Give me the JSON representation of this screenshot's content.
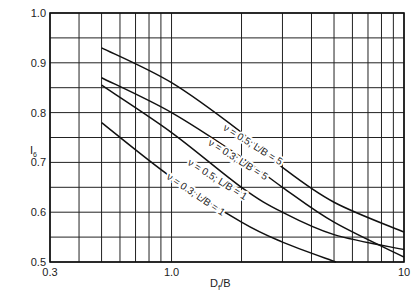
{
  "chart_data": {
    "type": "line",
    "title": "",
    "xlabel": "Df/B",
    "ylabel": "I6",
    "xscale": "log",
    "xlim": [
      0.3,
      10
    ],
    "ylim": [
      0.5,
      1.0
    ],
    "grid": true,
    "x_tick_labels": [
      "0.3",
      "1.0",
      "10"
    ],
    "y_tick_labels": [
      "0.5",
      "0.6",
      "0.7",
      "0.8",
      "0.9",
      "1.0"
    ],
    "x_gridlines": [
      0.3,
      0.4,
      0.5,
      0.6,
      0.7,
      0.8,
      0.9,
      1,
      2,
      3,
      4,
      5,
      6,
      7,
      8,
      9,
      10
    ],
    "y_gridlines": [
      0.5,
      0.55,
      0.6,
      0.65,
      0.7,
      0.75,
      0.8,
      0.85,
      0.9,
      0.95,
      1.0
    ],
    "series": [
      {
        "name": "ν = 0.5; L/B = 5",
        "x": [
          0.5,
          1,
          2,
          3,
          5,
          10
        ],
        "y": [
          0.93,
          0.86,
          0.76,
          0.69,
          0.62,
          0.56
        ]
      },
      {
        "name": "ν = 0.3; L/B = 5",
        "x": [
          0.5,
          1,
          2,
          3,
          5,
          10
        ],
        "y": [
          0.87,
          0.8,
          0.71,
          0.65,
          0.58,
          0.51
        ]
      },
      {
        "name": "ν = 0.5; L/B = 1",
        "x": [
          0.5,
          1,
          2,
          3,
          5,
          10
        ],
        "y": [
          0.855,
          0.76,
          0.65,
          0.6,
          0.555,
          0.525
        ]
      },
      {
        "name": "ν = 0.3; L/B = 1",
        "x": [
          0.5,
          1,
          2,
          3,
          5.1
        ],
        "y": [
          0.78,
          0.67,
          0.58,
          0.54,
          0.5
        ]
      }
    ],
    "annotations": [
      {
        "text": "ν = 0.5; L/B = 5",
        "x": 2.2,
        "y": 0.73,
        "rotation": 32
      },
      {
        "text": "ν = 0.3; L/B = 5",
        "x": 1.9,
        "y": 0.7,
        "rotation": 32
      },
      {
        "text": "ν = 0.5; L/B = 1",
        "x": 1.55,
        "y": 0.66,
        "rotation": 32
      },
      {
        "text": "ν = 0.3; L/B = 1",
        "x": 1.25,
        "y": 0.63,
        "rotation": 34
      }
    ]
  },
  "axes": {
    "xlabel_main": "D",
    "xlabel_sub": "f",
    "xlabel_tail": "/B",
    "ylabel_main": "I",
    "ylabel_sub": "6"
  }
}
